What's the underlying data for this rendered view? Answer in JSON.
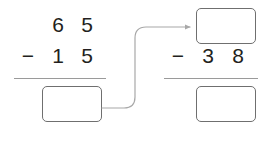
{
  "diagram": {
    "type": "subtraction-chain-worksheet",
    "background_color": "#ffffff",
    "digit_color": "#231f20",
    "rule_color": "#9a9a9a",
    "box_border_color": "#6f6f6f",
    "arrow_color": "#a8a8a8"
  },
  "problems": [
    {
      "id": "left-problem",
      "name": "first-subtraction",
      "minuend": {
        "label": "65",
        "tens": "6",
        "ones": "5"
      },
      "operator": "−",
      "subtrahend": {
        "label": "15",
        "tens": "1",
        "ones": "5"
      },
      "answer_box": {
        "value": "",
        "placeholder": "",
        "empty": true
      }
    },
    {
      "id": "right-problem",
      "name": "second-subtraction",
      "minuend": {
        "label": "",
        "tens": "",
        "ones": "",
        "is_box": true,
        "empty": true
      },
      "operator": "−",
      "subtrahend": {
        "label": "38",
        "tens": "3",
        "ones": "8"
      },
      "answer_box": {
        "value": "",
        "placeholder": "",
        "empty": true
      }
    }
  ],
  "connector": {
    "name": "flow-arrow",
    "from": "left-problem-answer-box",
    "to": "right-problem-minuend-box",
    "style": "curved",
    "has_arrowhead": true,
    "label": ""
  }
}
